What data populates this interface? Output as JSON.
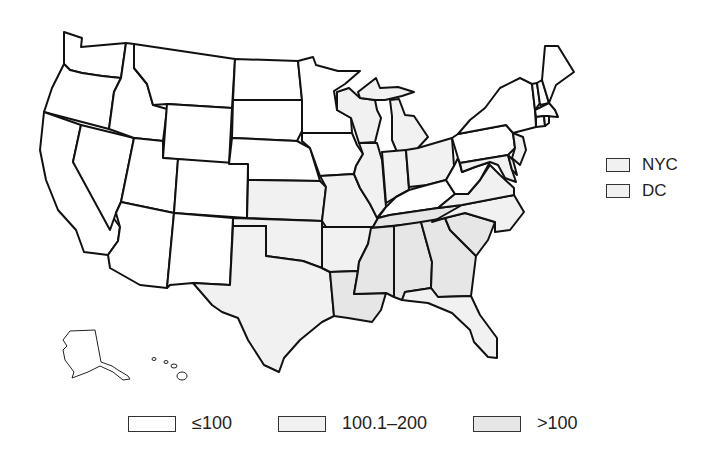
{
  "categories": {
    "low": {
      "label": "≤100",
      "color": "#ffffff"
    },
    "mid": {
      "label": "100.1–200",
      "color": "#f1f1f1"
    },
    "high": {
      "label": ">100",
      "color": "#e6e6e6"
    }
  },
  "side_legend": [
    {
      "label": "NYC",
      "color": "#f1f1f1"
    },
    {
      "label": "DC",
      "color": "#f1f1f1"
    }
  ],
  "bottom_legend": [
    {
      "label": "≤100",
      "color": "#ffffff"
    },
    {
      "label": "100.1–200",
      "color": "#f1f1f1"
    },
    {
      "label": ">100",
      "color": "#e6e6e6"
    }
  ],
  "states": {
    "low": [
      "WA",
      "OR",
      "CA",
      "NV",
      "ID",
      "MT",
      "WY",
      "UT",
      "CO",
      "AZ",
      "NM",
      "ND",
      "SD",
      "NE",
      "MN",
      "IA",
      "KY",
      "WV",
      "PA",
      "NY",
      "VT",
      "NH",
      "ME",
      "MA",
      "CT",
      "RI",
      "AK",
      "HI"
    ],
    "mid": [
      "KS",
      "OK",
      "TX",
      "MO",
      "AR",
      "WI",
      "MI",
      "IL",
      "IN",
      "OH",
      "VA",
      "NC",
      "FL",
      "NJ",
      "MD",
      "DE"
    ],
    "high": [
      "LA",
      "MS",
      "AL",
      "TN",
      "GA",
      "SC"
    ]
  }
}
